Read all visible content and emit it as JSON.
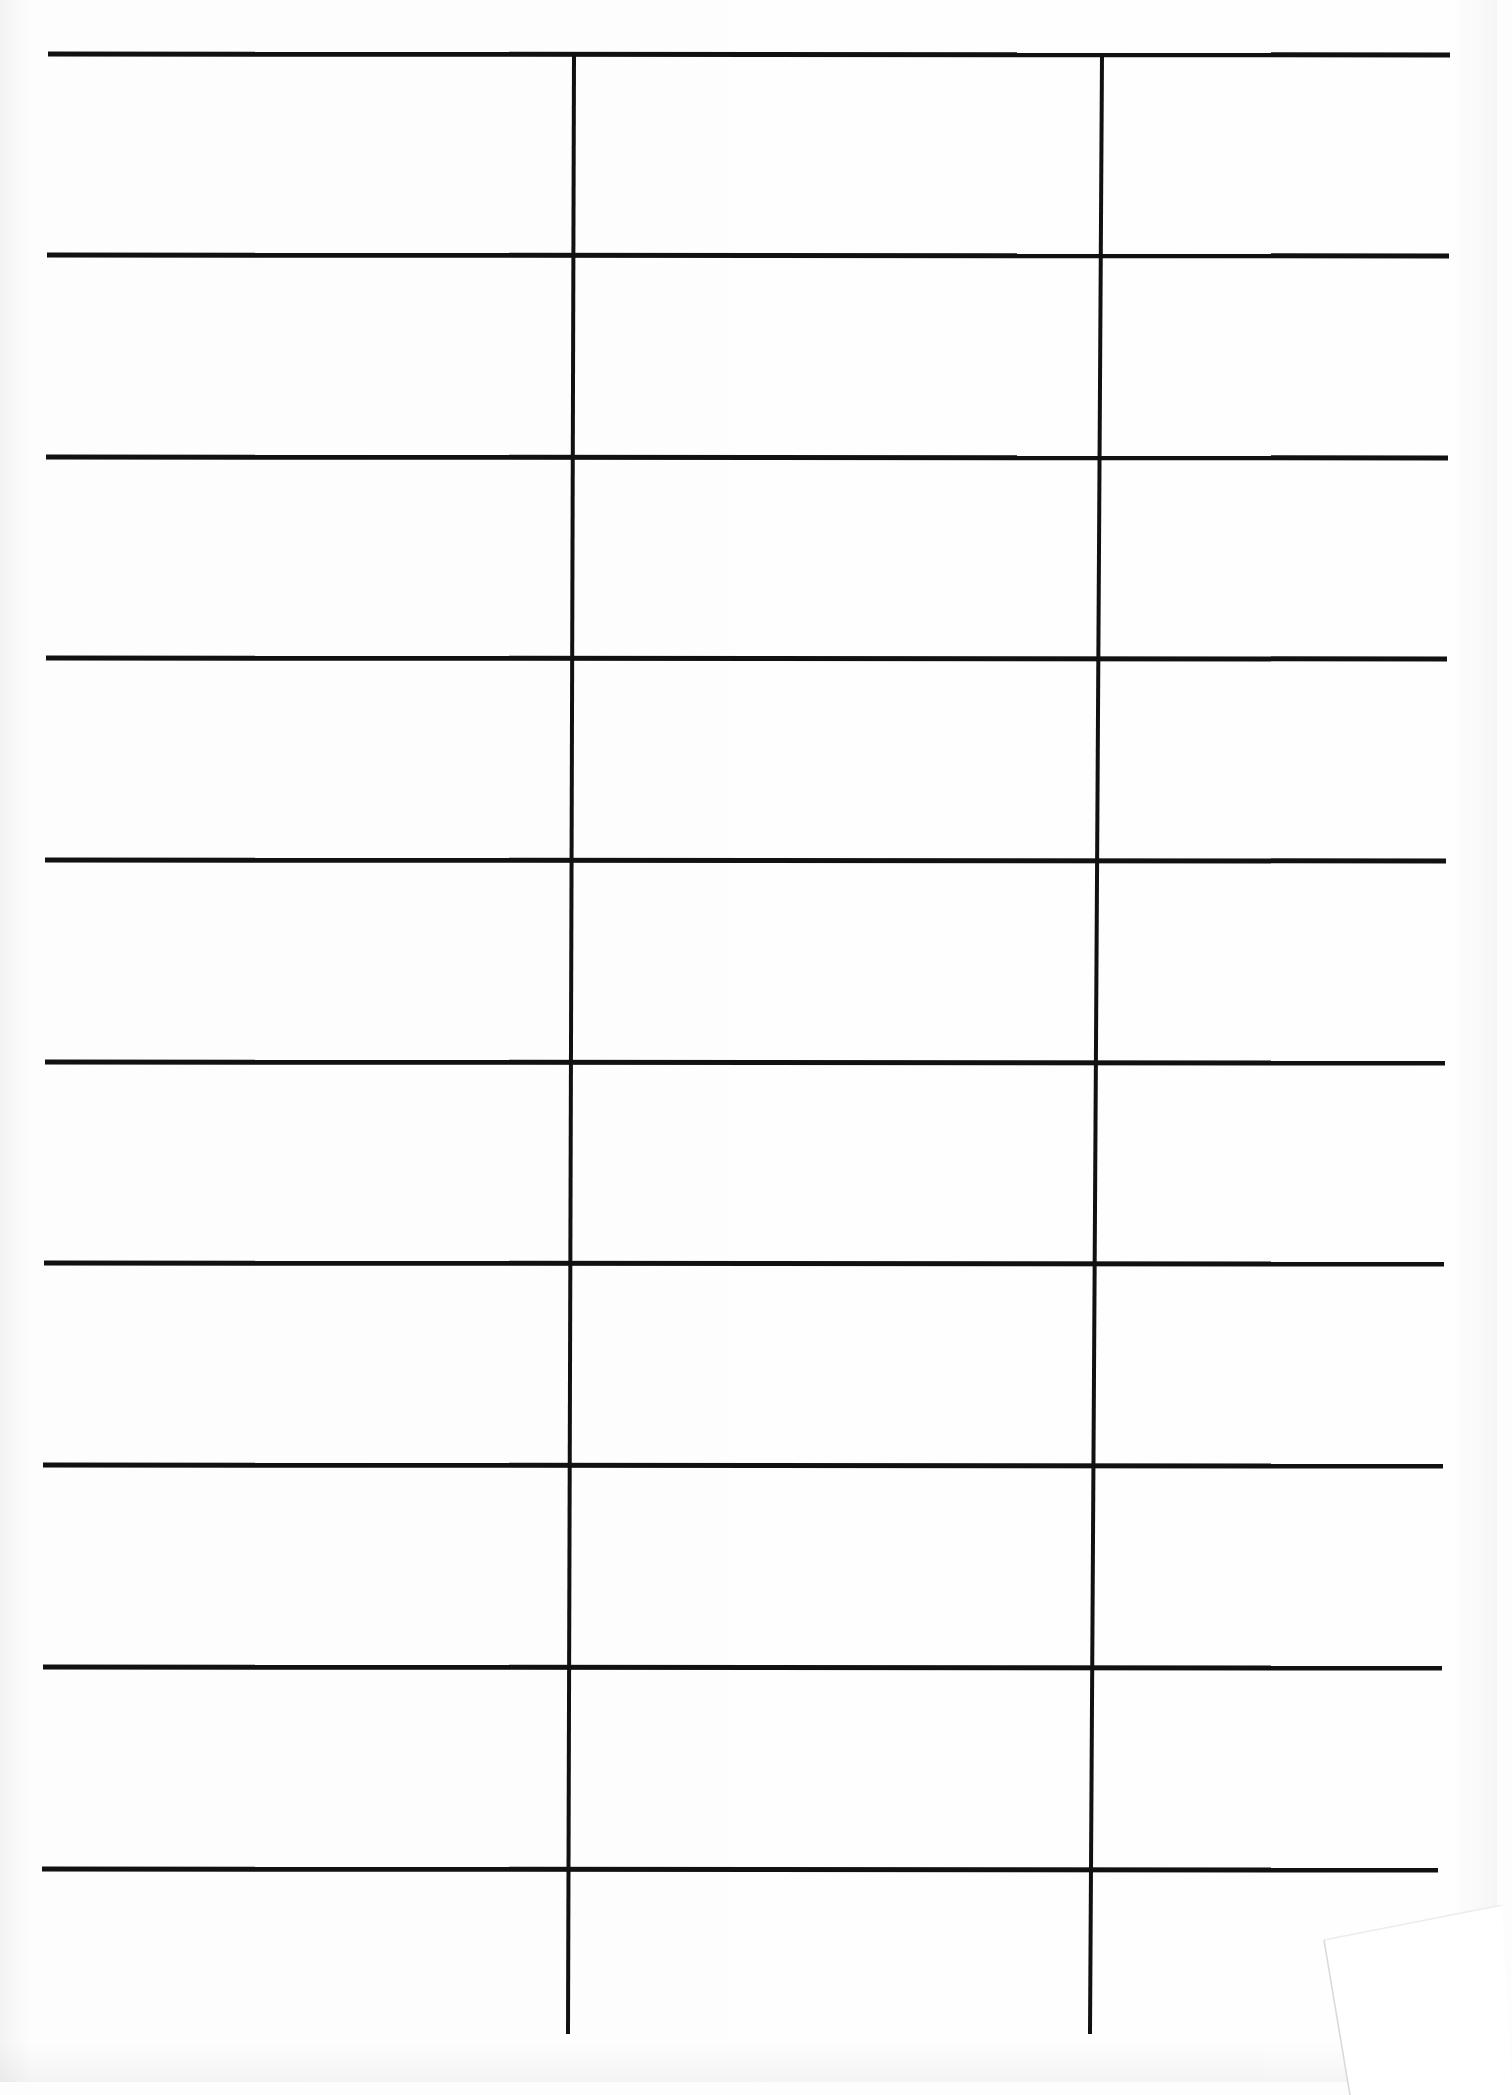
{
  "document": {
    "type": "blank ruled grid form",
    "background_color": "#fdfdfd",
    "line_color": "#111111",
    "columns": 3,
    "rows": 10,
    "horizontal_rules": [
      {
        "x1": 48,
        "y1": 54,
        "x2": 1450,
        "y2": 55
      },
      {
        "x1": 47,
        "y1": 255,
        "x2": 1449,
        "y2": 256
      },
      {
        "x1": 46,
        "y1": 457,
        "x2": 1448,
        "y2": 458
      },
      {
        "x1": 46,
        "y1": 658,
        "x2": 1447,
        "y2": 659
      },
      {
        "x1": 45,
        "y1": 860,
        "x2": 1446,
        "y2": 861
      },
      {
        "x1": 45,
        "y1": 1062,
        "x2": 1445,
        "y2": 1063
      },
      {
        "x1": 44,
        "y1": 1263,
        "x2": 1444,
        "y2": 1264
      },
      {
        "x1": 43,
        "y1": 1465,
        "x2": 1443,
        "y2": 1466
      },
      {
        "x1": 43,
        "y1": 1667,
        "x2": 1442,
        "y2": 1668
      },
      {
        "x1": 42,
        "y1": 1869,
        "x2": 1438,
        "y2": 1870
      }
    ],
    "vertical_rules": [
      {
        "x1": 574,
        "y1": 55,
        "x2": 568,
        "y2": 2034
      },
      {
        "x1": 1102,
        "y1": 55,
        "x2": 1090,
        "y2": 2034
      }
    ],
    "folded_corner": {
      "visible": true,
      "position": "bottom-right"
    },
    "text_content": []
  }
}
